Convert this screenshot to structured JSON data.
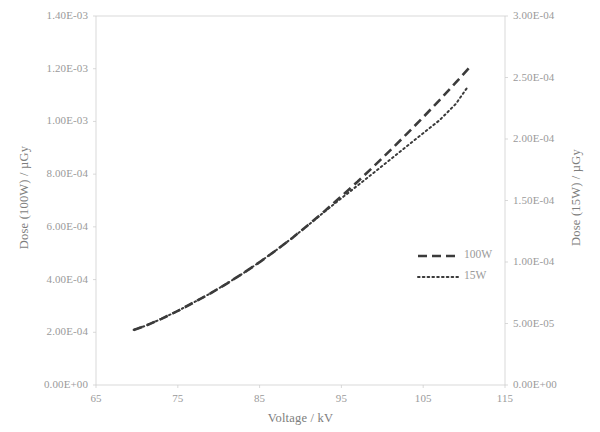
{
  "chart_data": {
    "type": "line",
    "title": "",
    "xlabel": "Voltage / kV",
    "ylabel": "Dose (100W) / µGy",
    "y2label": "Dose (15W) / µGy",
    "xlim": [
      65,
      115
    ],
    "ylim": [
      0,
      0.0014
    ],
    "y2lim": [
      0,
      0.0003
    ],
    "grid": false,
    "legend_position": "center-right",
    "x_ticks": [
      "65",
      "75",
      "85",
      "95",
      "105",
      "115"
    ],
    "x_tick_values": [
      65,
      75,
      85,
      95,
      105,
      115
    ],
    "y_ticks": [
      "0.00E+00",
      "2.00E-04",
      "4.00E-04",
      "6.00E-04",
      "8.00E-04",
      "1.00E-03",
      "1.20E-03",
      "1.40E-03"
    ],
    "y_tick_values": [
      0,
      0.0002,
      0.0004,
      0.0006,
      0.0008,
      0.001,
      0.0012,
      0.0014
    ],
    "y2_ticks": [
      "0.00E+00",
      "5.00E-05",
      "1.00E-04",
      "1.50E-04",
      "2.00E-04",
      "2.50E-04",
      "3.00E-04"
    ],
    "y2_tick_values": [
      0,
      5e-05,
      0.0001,
      0.00015,
      0.0002,
      0.00025,
      0.0003
    ],
    "line_color": "#3b3b3b",
    "series": [
      {
        "name": "100W",
        "axis": "left",
        "style": "dashed",
        "x": [
          69.6,
          71,
          73,
          75,
          77,
          79,
          81,
          83,
          85,
          87,
          89,
          91,
          93,
          95,
          97,
          99,
          101,
          103,
          105,
          107,
          109,
          110.9
        ],
        "values": [
          0.000209,
          0.000224,
          0.000251,
          0.000281,
          0.000314,
          0.000348,
          0.000385,
          0.000424,
          0.000466,
          0.000511,
          0.000558,
          0.000609,
          0.000661,
          0.000716,
          0.000772,
          0.000831,
          0.000891,
          0.000953,
          0.001016,
          0.001081,
          0.001148,
          0.001213
        ]
      },
      {
        "name": "15W",
        "axis": "right",
        "style": "dotted",
        "x": [
          69.6,
          71,
          73,
          75,
          77,
          79,
          81,
          83,
          85,
          87,
          89,
          91,
          93,
          95,
          97,
          99,
          101,
          103,
          105,
          107,
          109,
          110.4
        ],
        "values": [
          4.48e-05,
          4.8e-05,
          5.38e-05,
          6.02e-05,
          6.73e-05,
          7.46e-05,
          8.25e-05,
          9.09e-05,
          9.99e-05,
          0.0001095,
          0.0001196,
          0.0001303,
          0.0001412,
          0.0001518,
          0.0001623,
          0.0001728,
          0.0001834,
          0.0001941,
          0.0002047,
          0.0002153,
          0.0002286,
          0.000242
        ]
      }
    ],
    "legend": [
      {
        "label": "100W",
        "style": "dashed"
      },
      {
        "label": "15W",
        "style": "dotted"
      }
    ]
  }
}
